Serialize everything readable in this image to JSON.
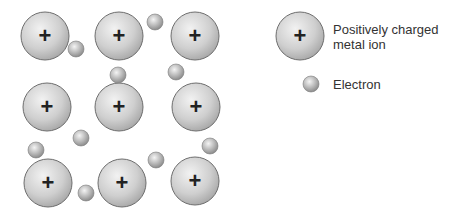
{
  "diagram": {
    "colors": {
      "ion_fill_light": "#e8e8e8",
      "ion_fill_dark": "#a9a9a9",
      "ion_stroke": "#6e6e6e",
      "electron_fill_light": "#eeeeee",
      "electron_fill_dark": "#8f8f8f",
      "plus_color": "#222222"
    },
    "ion_symbol": "+",
    "ions": [
      {
        "x": 45,
        "y": 36
      },
      {
        "x": 119,
        "y": 36
      },
      {
        "x": 195,
        "y": 36
      },
      {
        "x": 47,
        "y": 107
      },
      {
        "x": 119,
        "y": 107
      },
      {
        "x": 196,
        "y": 107
      },
      {
        "x": 48,
        "y": 183
      },
      {
        "x": 122,
        "y": 183
      },
      {
        "x": 195,
        "y": 181
      }
    ],
    "electrons": [
      {
        "x": 76,
        "y": 49
      },
      {
        "x": 155,
        "y": 22
      },
      {
        "x": 118,
        "y": 75
      },
      {
        "x": 176,
        "y": 72
      },
      {
        "x": 81,
        "y": 138
      },
      {
        "x": 36,
        "y": 150
      },
      {
        "x": 210,
        "y": 146
      },
      {
        "x": 156,
        "y": 160
      },
      {
        "x": 86,
        "y": 193
      }
    ]
  },
  "legend": {
    "ion_label_line1": "Positively charged",
    "ion_label_line2": "metal ion",
    "electron_label": "Electron"
  }
}
